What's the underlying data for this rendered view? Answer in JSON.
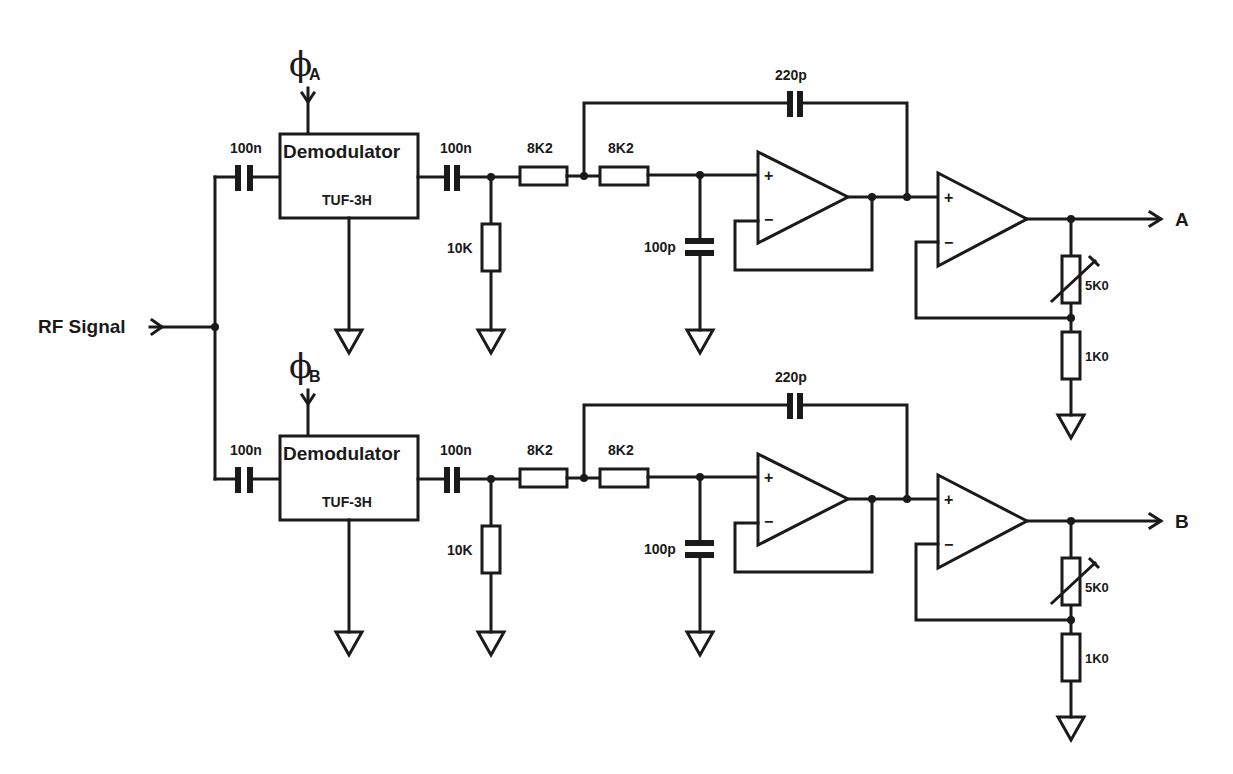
{
  "diagram": {
    "type": "circuit-schematic",
    "input_label": "RF Signal",
    "channels": [
      {
        "id": "A",
        "phase_label": "ϕ",
        "phase_sub": "A",
        "input_cap": "100n",
        "demodulator": {
          "title": "Demodulator",
          "part": "TUF-3H"
        },
        "coupling_cap": "100n",
        "shunt_resistor": "10K",
        "series_resistor_1": "8K2",
        "series_resistor_2": "8K2",
        "feedback_cap": "220p",
        "shunt_cap": "100p",
        "buffer_opamp": {
          "plus": "+",
          "minus": "−"
        },
        "gain_opamp": {
          "plus": "+",
          "minus": "−"
        },
        "trim_resistor": "5K0",
        "ground_resistor": "1K0",
        "output_label": "A"
      },
      {
        "id": "B",
        "phase_label": "ϕ",
        "phase_sub": "B",
        "input_cap": "100n",
        "demodulator": {
          "title": "Demodulator",
          "part": "TUF-3H"
        },
        "coupling_cap": "100n",
        "shunt_resistor": "10K",
        "series_resistor_1": "8K2",
        "series_resistor_2": "8K2",
        "feedback_cap": "220p",
        "shunt_cap": "100p",
        "buffer_opamp": {
          "plus": "+",
          "minus": "−"
        },
        "gain_opamp": {
          "plus": "+",
          "minus": "−"
        },
        "trim_resistor": "5K0",
        "ground_resistor": "1K0",
        "output_label": "B"
      }
    ]
  }
}
